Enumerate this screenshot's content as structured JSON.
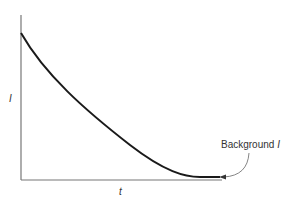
{
  "chart_data": {
    "type": "line",
    "title": "",
    "xlabel": "t",
    "ylabel": "I",
    "grid": false,
    "legend": null,
    "series": [
      {
        "name": "I(t) decay",
        "x": [
          0,
          0.1,
          0.2,
          0.3,
          0.4,
          0.5,
          0.6,
          0.7,
          0.8,
          0.9,
          1.0
        ],
        "values": [
          1.0,
          0.82,
          0.66,
          0.52,
          0.38,
          0.26,
          0.15,
          0.07,
          0.02,
          0.0,
          0.0
        ]
      }
    ],
    "annotations": [
      {
        "text": "Background I",
        "points_to": "flat tail of curve (right end)"
      }
    ],
    "xlim": [
      0,
      1
    ],
    "ylim": [
      0,
      1.2
    ],
    "tick_labels": {
      "x": [],
      "y": []
    }
  },
  "labels": {
    "x_axis": "t",
    "y_axis": "I",
    "annotation": "Background I"
  },
  "colors": {
    "curve": "#1a1a1a",
    "axis": "#666666",
    "text": "#333333"
  }
}
